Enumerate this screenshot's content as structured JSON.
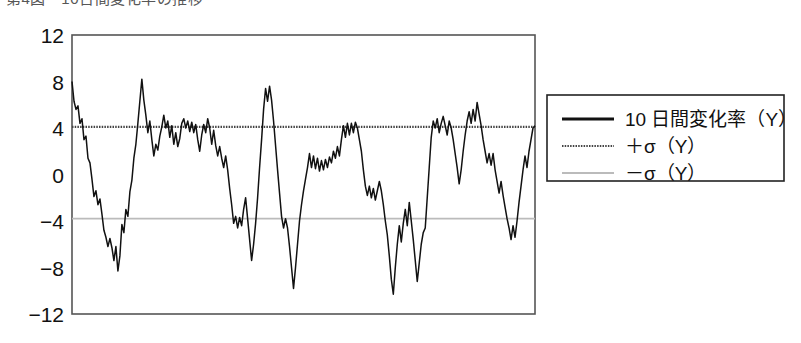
{
  "figure": {
    "clipped_top_caption": "第4図　10日間変化率の推移",
    "background_color": "#ffffff"
  },
  "axis": {
    "y_ticks": [
      "12",
      "8",
      "4",
      "0",
      "-4",
      "-8",
      "-12"
    ],
    "y_tick_values": [
      12,
      8,
      4,
      0,
      -4,
      -8,
      -12
    ],
    "frame_color": "#555555"
  },
  "legend": {
    "border_color": "#222222",
    "items": [
      {
        "label": "10 日間変化率（Y）",
        "color": "#111111",
        "width": 3.0,
        "style": "solid"
      },
      {
        "label": "＋σ（Y）",
        "color": "#444444",
        "width": 2.0,
        "style": "dotted"
      },
      {
        "label": "－σ（Y）",
        "color": "#bbbbbb",
        "width": 2.0,
        "style": "solid"
      }
    ]
  },
  "chart_data": {
    "type": "line",
    "title": "第4図　10日間変化率の推移",
    "xlabel": "",
    "ylabel": "",
    "ylim": [
      -12,
      12
    ],
    "xlim": [
      0,
      185
    ],
    "grid": false,
    "legend_position": "right-outside",
    "y_ticks": [
      12,
      8,
      4,
      0,
      -4,
      -8,
      -12
    ],
    "x_axis_ticks_shown": false,
    "annotations": [
      {
        "text": "+σ(Y) reference line",
        "y": 4.1
      },
      {
        "text": "-σ(Y) reference line",
        "y": -3.8
      }
    ],
    "series": [
      {
        "name": "10 日間変化率（Y）",
        "color": "#111111",
        "values": [
          8.0,
          6.3,
          5.6,
          5.9,
          4.4,
          4.8,
          3.0,
          3.3,
          1.4,
          1.0,
          -0.4,
          -1.9,
          -1.4,
          -2.6,
          -2.1,
          -3.4,
          -4.8,
          -5.4,
          -6.2,
          -5.5,
          -6.3,
          -7.4,
          -6.2,
          -8.3,
          -7.0,
          -4.3,
          -5.0,
          -3.0,
          -3.6,
          -1.5,
          -0.5,
          1.4,
          2.6,
          4.4,
          6.3,
          8.2,
          6.4,
          5.1,
          3.6,
          4.6,
          3.0,
          1.6,
          2.6,
          2.1,
          3.3,
          4.1,
          5.1,
          4.0,
          4.6,
          3.2,
          4.2,
          2.6,
          3.6,
          2.4,
          3.1,
          4.4,
          4.8,
          4.0,
          4.6,
          3.7,
          4.5,
          3.6,
          4.3,
          3.0,
          2.0,
          3.4,
          4.3,
          3.6,
          4.8,
          4.0,
          2.6,
          3.8,
          2.5,
          1.6,
          2.4,
          1.4,
          0.6,
          1.6,
          0.4,
          -1.2,
          -2.6,
          -4.2,
          -3.6,
          -4.6,
          -3.7,
          -4.4,
          -3.0,
          -2.0,
          -3.8,
          -5.6,
          -7.4,
          -6.0,
          -4.2,
          -2.0,
          0.6,
          3.0,
          5.6,
          7.4,
          6.3,
          7.6,
          6.4,
          4.6,
          2.5,
          0.4,
          -1.6,
          -3.6,
          -4.6,
          -3.8,
          -4.6,
          -6.2,
          -8.0,
          -9.8,
          -8.0,
          -6.0,
          -4.0,
          -2.6,
          -1.4,
          -0.4,
          0.6,
          1.8,
          0.6,
          1.6,
          0.5,
          1.4,
          0.3,
          1.2,
          0.4,
          1.3,
          0.6,
          1.5,
          1.0,
          2.0,
          1.4,
          2.4,
          1.6,
          3.0,
          4.2,
          3.2,
          4.4,
          3.4,
          4.4,
          3.6,
          4.5,
          4.0,
          3.0,
          2.0,
          0.4,
          -1.0,
          -1.8,
          -1.0,
          -2.0,
          -1.2,
          -2.2,
          -1.4,
          -0.6,
          -1.4,
          -2.6,
          -4.0,
          -5.2,
          -7.0,
          -9.0,
          -10.3,
          -8.0,
          -6.0,
          -4.4,
          -5.8,
          -4.2,
          -3.0,
          -4.4,
          -2.4,
          -4.0,
          -5.6,
          -7.4,
          -9.2,
          -7.6,
          -6.0,
          -5.0,
          -4.6,
          -2.0,
          0.6,
          3.2,
          4.6,
          4.0,
          4.8,
          3.6,
          4.4,
          5.0,
          4.2,
          3.4,
          4.6,
          4.0,
          3.0,
          1.8,
          0.6,
          -0.8,
          0.4,
          2.0,
          3.4,
          4.6,
          5.4,
          4.4,
          5.6,
          4.6,
          6.2,
          5.2,
          4.2,
          3.0,
          2.0,
          1.0,
          1.8,
          0.8,
          1.8,
          0.4,
          -0.6,
          -1.6,
          -0.6,
          -1.8,
          -2.8,
          -3.8,
          -4.6,
          -5.6,
          -4.4,
          -5.4,
          -4.0,
          -2.4,
          -1.0,
          0.4,
          1.6,
          0.6,
          2.0,
          3.0,
          4.0,
          4.2
        ]
      },
      {
        "name": "＋σ（Y）",
        "color": "#444444",
        "constant": 4.1
      },
      {
        "name": "－σ（Y）",
        "color": "#bbbbbb",
        "constant": -3.8
      }
    ]
  }
}
